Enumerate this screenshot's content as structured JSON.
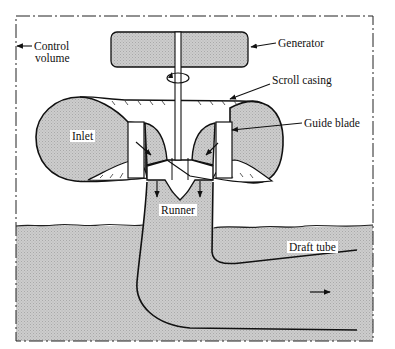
{
  "figure": {
    "colors": {
      "fill": "#c9c9c9",
      "line": "#1a1a1a",
      "background": "#ffffff"
    }
  },
  "labels": {
    "control_volume_line1": "Control",
    "control_volume_line2": "volume",
    "generator": "Generator",
    "scroll_casing": "Scroll casing",
    "guide_blade": "Guide blade",
    "inlet": "Inlet",
    "runner": "Runner",
    "draft_tube": "Draft tube"
  }
}
